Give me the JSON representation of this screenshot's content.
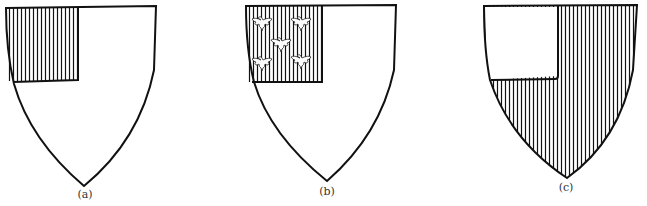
{
  "figures": [
    {
      "id": "a",
      "caption": "(a)",
      "description": "Shield with plain canton, hatched vertically (gules) on a plain field"
    },
    {
      "id": "b",
      "caption": "(b)",
      "description": "Shield with canton hatched vertically charged with five eagles displayed, on a plain field"
    },
    {
      "id": "c",
      "caption": "(c)",
      "description": "Shield hatched vertically (gules) with a plain canton"
    }
  ],
  "colors": {
    "ink": "#111111",
    "paper": "#ffffff"
  }
}
